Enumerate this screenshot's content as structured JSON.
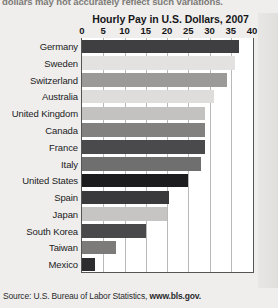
{
  "clipped_top_text": "dollars may not accurately reflect such variations.",
  "source": {
    "prefix": "Source: U.S. Bureau of Labor Statistics, ",
    "url": "www.bls.gov."
  },
  "chart_data": {
    "type": "bar",
    "orientation": "horizontal",
    "title": "Hourly Pay in U.S. Dollars, 2007",
    "xlabel": "",
    "ylabel": "",
    "xlim": [
      0,
      40
    ],
    "xticks": [
      0,
      5,
      10,
      15,
      20,
      25,
      30,
      35,
      40
    ],
    "tick_labels": [
      "0",
      "5",
      "10",
      "15",
      "20",
      "25",
      "30",
      "35",
      "40"
    ],
    "grid": true,
    "legend": "none",
    "categories": [
      "Germany",
      "Sweden",
      "Switzerland",
      "Australia",
      "United Kingdom",
      "Canada",
      "France",
      "Italy",
      "United States",
      "Spain",
      "Japan",
      "South Korea",
      "Taiwan",
      "Mexico"
    ],
    "values": [
      37,
      36,
      34,
      31,
      29,
      29,
      29,
      28,
      25,
      20.5,
      20,
      15,
      8,
      3
    ],
    "bar_colors": [
      "#3f3f41",
      "#e3e2e0",
      "#9b9a98",
      "#dedddb",
      "#c3c2c0",
      "#828180",
      "#4a4a4c",
      "#6f6f70",
      "#1c1c1e",
      "#3a3a3c",
      "#c6c5c3",
      "#49494b",
      "#7c7b7a",
      "#2c2c2e"
    ],
    "highlight_category": "United States"
  }
}
